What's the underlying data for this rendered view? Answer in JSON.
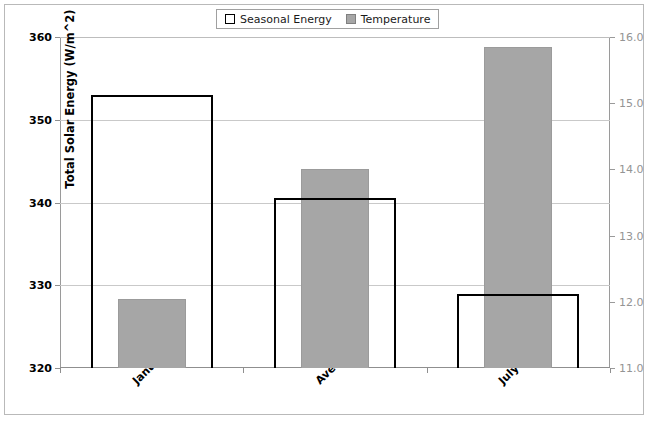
{
  "legend": {
    "entries": [
      {
        "label": "Seasonal Energy",
        "style": "outline",
        "color": "#000000"
      },
      {
        "label": "Temperature",
        "style": "filled",
        "color": "#a6a6a6"
      }
    ]
  },
  "axes": {
    "left": {
      "title": "Total Solar Energy (W/m^2)",
      "ticks": [
        "320",
        "330",
        "340",
        "350",
        "360"
      ],
      "min": 320,
      "max": 360,
      "step": 10
    },
    "right": {
      "title": "Temperature of the Earth (°C)",
      "ticks": [
        "11.0",
        "12.0",
        "13.0",
        "14.0",
        "15.0",
        "16.0"
      ],
      "min": 11.0,
      "max": 16.0,
      "step": 1.0
    },
    "category": {
      "labels": [
        "January",
        "Average",
        "July"
      ]
    }
  },
  "chart_data": {
    "type": "bar",
    "title": "",
    "categories": [
      "January",
      "Average",
      "July"
    ],
    "series": [
      {
        "name": "Seasonal Energy",
        "axis": "left",
        "unit": "W/m^2",
        "color": "#ffffff",
        "edge_color": "#000000",
        "values": [
          353,
          340.5,
          329
        ]
      },
      {
        "name": "Temperature",
        "axis": "right",
        "unit": "°C",
        "color": "#a6a6a6",
        "values": [
          12.05,
          14.0,
          15.85
        ]
      }
    ],
    "xlabel": "",
    "ylabel": "Total Solar Energy (W/m^2)",
    "y2label": "Temperature of the Earth (°C)",
    "ylim": [
      320,
      360
    ],
    "y2lim": [
      11.0,
      16.0
    ],
    "grid": true,
    "legend_position": "top-center"
  }
}
